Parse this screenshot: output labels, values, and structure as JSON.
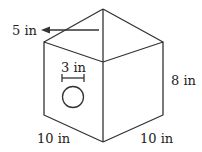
{
  "diagram": {
    "labels": {
      "roof_height": "5 in",
      "hole_diameter": "3 in",
      "box_height": "8 in",
      "left_width": "10 in",
      "right_width": "10 in"
    },
    "colors": {
      "stroke": "#333333",
      "background": "#ffffff"
    }
  }
}
